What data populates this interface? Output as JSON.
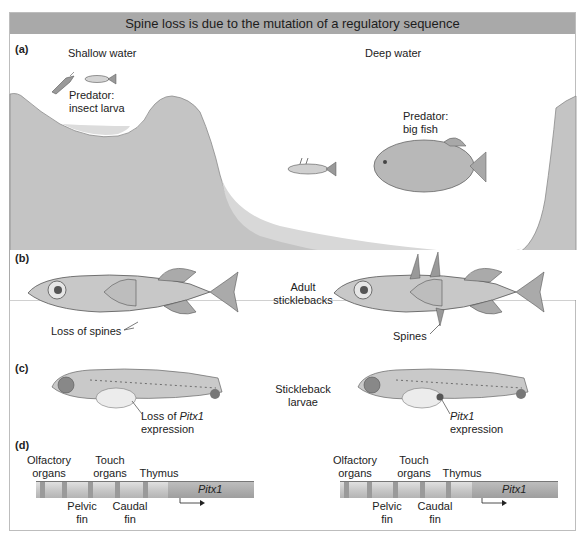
{
  "title": "Spine loss is due to the mutation of a regulatory sequence",
  "colors": {
    "header_bg": "#a9a9a9",
    "terrain": "#c4c4c4",
    "sediment": "#d6d6d6",
    "frame_border": "#bdbdbd"
  },
  "panels": {
    "a": {
      "label": "(a)",
      "shallow_label": "Shallow water",
      "deep_label": "Deep water",
      "predator_shallow": {
        "line1": "Predator:",
        "line2": "insect larva"
      },
      "predator_deep": {
        "line1": "Predator:",
        "line2": "big fish"
      }
    },
    "b": {
      "label": "(b)",
      "center_label": {
        "line1": "Adult",
        "line2": "sticklebacks"
      },
      "left_annotation": "Loss of spines",
      "right_annotation": "Spines"
    },
    "c": {
      "label": "(c)",
      "center_label": {
        "line1": "Stickleback",
        "line2": "larvae"
      },
      "left_annotation": {
        "line1_prefix": "Loss of ",
        "line1_italic": "Pitx1",
        "line2": "expression"
      },
      "right_annotation": {
        "line1_italic": "Pitx1",
        "line2": "expression"
      }
    },
    "d": {
      "label": "(d)",
      "gene_name": "Pitx1",
      "deleted_marker": "X",
      "left": {
        "top_labels": [
          {
            "line1": "Olfactory",
            "line2": "organs"
          },
          {
            "line1": "Touch",
            "line2": "organs"
          },
          {
            "line1": "Thymus",
            "line2": ""
          }
        ],
        "bottom_labels": [
          {
            "line1": "Pelvic",
            "line2": "fin"
          },
          {
            "line1": "Caudal",
            "line2": "fin"
          }
        ]
      },
      "right": {
        "top_labels": [
          {
            "line1": "Olfactory",
            "line2": "organs"
          },
          {
            "line1": "Touch",
            "line2": "organs"
          },
          {
            "line1": "Thymus",
            "line2": ""
          }
        ],
        "bottom_labels": [
          {
            "line1": "Pelvic",
            "line2": "fin"
          },
          {
            "line1": "Caudal",
            "line2": "fin"
          }
        ]
      }
    }
  }
}
